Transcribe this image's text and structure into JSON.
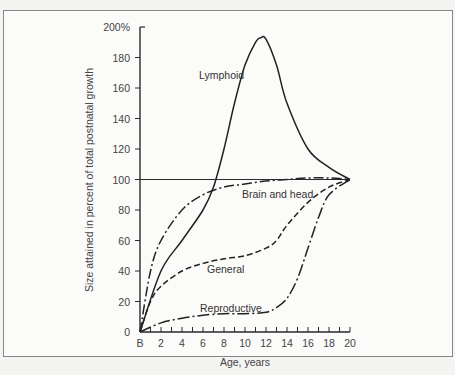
{
  "chart_data": {
    "type": "line",
    "title": "",
    "xlabel": "Age, years",
    "ylabel": "Size attained in percent of total postnatal growth",
    "xlim": [
      0,
      20
    ],
    "ylim": [
      0,
      200
    ],
    "x_tick_labels": [
      "B",
      "2",
      "4",
      "6",
      "8",
      "10",
      "12",
      "14",
      "16",
      "18",
      "20"
    ],
    "y_tick_labels": [
      "0",
      "20",
      "40",
      "60",
      "80",
      "100",
      "120",
      "140",
      "160",
      "180",
      "200%"
    ],
    "grid": false,
    "reference_line": {
      "y": 100
    },
    "series": [
      {
        "name": "Lymphoid",
        "style": "solid",
        "x": [
          0,
          2,
          4,
          6,
          7,
          8,
          9,
          10,
          11,
          11.5,
          12,
          13,
          14,
          16,
          18,
          20
        ],
        "y": [
          0,
          40,
          60,
          80,
          95,
          120,
          150,
          175,
          190,
          193,
          192,
          175,
          150,
          120,
          108,
          100
        ]
      },
      {
        "name": "Brain and head",
        "style": "dash-dot",
        "x": [
          0,
          1,
          2,
          4,
          6,
          8,
          10,
          12,
          14,
          16,
          18,
          20
        ],
        "y": [
          0,
          40,
          60,
          80,
          90,
          95,
          97,
          99,
          100,
          101,
          101,
          100
        ]
      },
      {
        "name": "General",
        "style": "dashed",
        "x": [
          0,
          1,
          2,
          4,
          6,
          8,
          10,
          12,
          13,
          14,
          16,
          18,
          20
        ],
        "y": [
          0,
          20,
          30,
          40,
          45,
          48,
          50,
          55,
          60,
          70,
          85,
          95,
          100
        ]
      },
      {
        "name": "Reproductive",
        "style": "dash-dot-long",
        "x": [
          0,
          2,
          4,
          6,
          8,
          10,
          12,
          13,
          14,
          15,
          16,
          17,
          18,
          20
        ],
        "y": [
          0,
          6,
          9,
          11,
          12,
          12,
          13,
          16,
          22,
          35,
          55,
          75,
          90,
          100
        ]
      }
    ],
    "annotations": [
      "Lymphoid",
      "Brain and head",
      "General",
      "Reproductive"
    ],
    "legend": "none (inline labels)"
  },
  "labels": {
    "xlabel": "Age, years",
    "ylabel": "Size attained in percent of total postnatal growth",
    "lymphoid": "Lymphoid",
    "brain": "Brain and head",
    "general": "General",
    "reproductive": "Reproductive"
  }
}
